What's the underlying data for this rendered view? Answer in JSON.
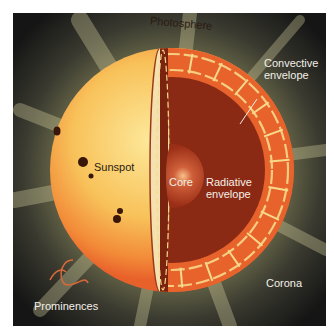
{
  "figure": {
    "labels": {
      "photosphere": "Photosphere",
      "convective_envelope_line1": "Convective",
      "convective_envelope_line2": "envelope",
      "sunspot": "Sunspot",
      "core": "Core",
      "radiative_envelope_line1": "Radiative",
      "radiative_envelope_line2": "envelope",
      "corona": "Corona",
      "prominences": "Prominences"
    },
    "colors": {
      "background": "#1a1a1a",
      "corona_glow": "#c9c48a",
      "surface_light": "#fbe08a",
      "surface_mid": "#f7b44a",
      "surface_edge": "#ee6a2a",
      "convective_zone": "#e8622c",
      "convection_cells": "#f6d98a",
      "radiative_zone": "#8a2a14",
      "core": "#b8401e",
      "core_highlight": "#f6b07a",
      "sunspot": "#3a1608"
    }
  }
}
